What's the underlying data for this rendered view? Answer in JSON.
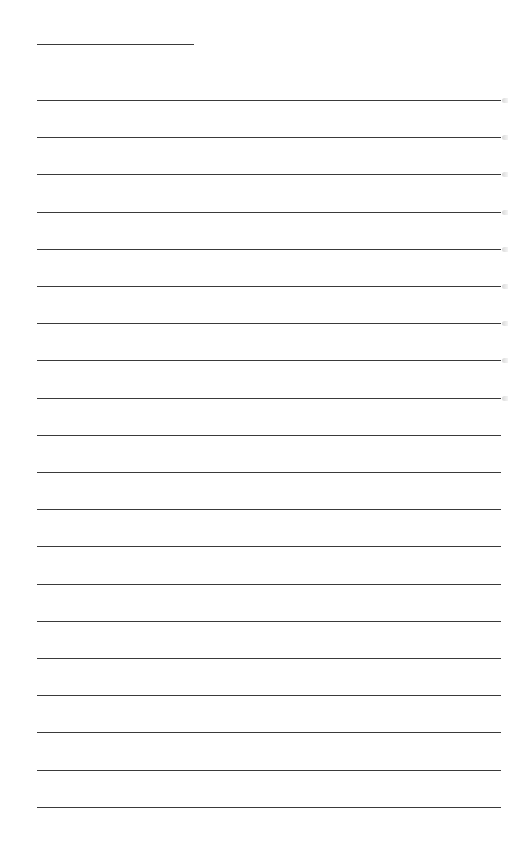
{
  "page": {
    "type": "blank-lined-writing-page",
    "background": "#ffffff",
    "line_color": "#3a3a3a"
  },
  "title_line": {
    "x": 37,
    "y": 44,
    "width": 157
  },
  "rules": {
    "count": 20,
    "start_y": 100,
    "spacing": 37.2,
    "x": 37,
    "width": 464,
    "edge_marks_count": 9
  }
}
